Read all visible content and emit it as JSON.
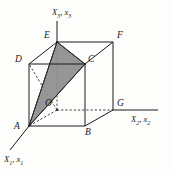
{
  "figure": {
    "type": "geometric-diagram",
    "background_color": "#fdfdfc",
    "line_color": "#1a1a1a",
    "shade_color": "#8d8d8d",
    "shade_edge_color": "#3a3a3a"
  },
  "axes": [
    {
      "id": "x3",
      "label_main": "X",
      "label_main_sub": "3",
      "label_second": "x",
      "label_second_sub": "3",
      "label_text": "X3, x3",
      "direction": "up",
      "from": [
        57,
        42
      ],
      "to": [
        57,
        21
      ]
    },
    {
      "id": "x2",
      "label_main": "X",
      "label_main_sub": "2",
      "label_second": "x",
      "label_second_sub": "2",
      "label_text": "X2, x2",
      "direction": "right",
      "from": [
        113,
        110
      ],
      "to": [
        158,
        110
      ]
    },
    {
      "id": "x1",
      "label_main": "X",
      "label_main_sub": "1",
      "label_second": "x",
      "label_second_sub": "1",
      "label_text": "X1, x1",
      "direction": "down-left",
      "from": [
        29,
        126
      ],
      "to": [
        10,
        150
      ]
    }
  ],
  "vertices": [
    {
      "id": "E",
      "label": "E",
      "x": 57,
      "y": 42,
      "label_x": 44,
      "label_y": 33,
      "hidden": false
    },
    {
      "id": "F",
      "label": "F",
      "x": 113,
      "y": 42,
      "label_x": 117,
      "label_y": 33,
      "hidden": false
    },
    {
      "id": "D",
      "label": "D",
      "x": 29,
      "y": 64,
      "label_x": 16,
      "label_y": 57,
      "hidden": false
    },
    {
      "id": "C",
      "label": "C",
      "x": 85,
      "y": 64,
      "label_x": 88,
      "label_y": 57,
      "hidden": false
    },
    {
      "id": "O",
      "label": "O",
      "x": 57,
      "y": 110,
      "label_x": 45,
      "label_y": 104,
      "hidden": true
    },
    {
      "id": "G",
      "label": "G",
      "x": 113,
      "y": 110,
      "label_x": 117,
      "label_y": 101,
      "hidden": false
    },
    {
      "id": "A",
      "label": "A",
      "x": 29,
      "y": 126,
      "label_x": 15,
      "label_y": 125,
      "hidden": false
    },
    {
      "id": "B",
      "label": "B",
      "x": 85,
      "y": 126,
      "label_x": 86,
      "label_y": 130,
      "hidden": false
    }
  ],
  "solid_edges": [
    {
      "from": "D",
      "to": "E"
    },
    {
      "from": "E",
      "to": "F"
    },
    {
      "from": "F",
      "to": "C"
    },
    {
      "from": "C",
      "to": "D"
    },
    {
      "from": "A",
      "to": "B"
    },
    {
      "from": "B",
      "to": "G"
    },
    {
      "from": "D",
      "to": "A"
    },
    {
      "from": "C",
      "to": "B"
    },
    {
      "from": "F",
      "to": "G"
    }
  ],
  "dashed_edges": [
    {
      "from": "O",
      "to": "E"
    },
    {
      "from": "O",
      "to": "G"
    },
    {
      "from": "O",
      "to": "D"
    },
    {
      "from": "O",
      "to": "A"
    }
  ],
  "shaded_triangle": {
    "vertices": [
      "A",
      "E",
      "C"
    ],
    "points": "29,126 57,42 85,64",
    "fill": "#8d8d8d",
    "stroke": "#2a2a2a"
  },
  "inner_lines": [
    {
      "from": "A",
      "to": "E",
      "style": "solid"
    },
    {
      "from": "E",
      "to": "C",
      "style": "solid"
    },
    {
      "from": "C",
      "to": "A",
      "style": "solid"
    }
  ]
}
